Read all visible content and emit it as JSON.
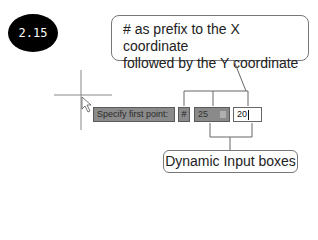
{
  "figure": {
    "badge": "2.15",
    "callout_top": {
      "line1": "# as prefix to the X coordinate",
      "line2": "followed by the Y coordinate"
    },
    "callout_bottom": "Dynamic Input boxes"
  },
  "dynamic_input": {
    "prompt": "Specify first point:",
    "prefix": "#",
    "x_value": "25",
    "y_value": "20"
  },
  "icons": {
    "crosshair": "crosshair-cursor",
    "pointer": "arrow-pointer",
    "spinner": "lock-spinner-icon"
  },
  "colors": {
    "badge_bg": "#000000",
    "input_gray": "#8a8a8a",
    "active_input": "#ffffff",
    "line": "#666666"
  }
}
